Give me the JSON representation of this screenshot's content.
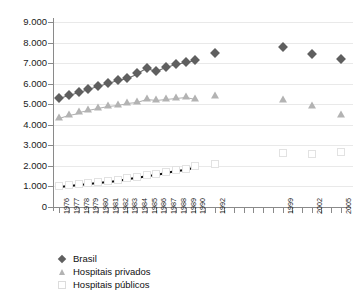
{
  "chart_data": {
    "type": "line",
    "title": "",
    "subtitle": "",
    "xlabel": "",
    "ylabel": "",
    "ylim": [
      0,
      9000
    ],
    "ytick_labels": [
      "9.000",
      "8.000",
      "7.000",
      "6.000",
      "5.000",
      "4.000",
      "3.000",
      "2.000",
      "1.000",
      "0"
    ],
    "ytick_values": [
      9000,
      8000,
      7000,
      6000,
      5000,
      4000,
      3000,
      2000,
      1000,
      0
    ],
    "grid": true,
    "legend_position": "below-left",
    "x": [
      1976,
      1977,
      1978,
      1979,
      1980,
      1981,
      1982,
      1983,
      1984,
      1985,
      1986,
      1987,
      1988,
      1989,
      1990,
      1991,
      1992,
      1993,
      1994,
      1995,
      1996,
      1997,
      1998,
      1999,
      2000,
      2001,
      2002,
      2003,
      2004,
      2005
    ],
    "xtick_labels": [
      "1976",
      "1977",
      "1978",
      "1979",
      "1980",
      "1981",
      "1982",
      "1983",
      "1984",
      "1985",
      "1986",
      "1987",
      "1988",
      "1989",
      "1990",
      "",
      "1992",
      "",
      "",
      "",
      "",
      "",
      "",
      "1999",
      "",
      "",
      "2002",
      "",
      "",
      "2005"
    ],
    "series": [
      {
        "name": "Brasil",
        "marker": "diamond",
        "color": "#5f5f5f",
        "line_color": "#6b6b6b",
        "line_style": "solid",
        "values": [
          5300,
          5450,
          5600,
          5750,
          5900,
          6050,
          6200,
          6300,
          6500,
          6750,
          6600,
          6800,
          6950,
          7050,
          7150,
          null,
          7500,
          null,
          null,
          null,
          null,
          null,
          null,
          7800,
          null,
          null,
          7450,
          null,
          null,
          7200
        ]
      },
      {
        "name": "Hospitais privados",
        "marker": "triangle",
        "color": "#b3b3b3",
        "line_color": "#b0b0b0",
        "line_style": "solid",
        "values": [
          4350,
          4500,
          4600,
          4700,
          4800,
          4900,
          4950,
          5050,
          5100,
          5250,
          5200,
          5250,
          5300,
          5350,
          5250,
          null,
          5400,
          null,
          null,
          null,
          null,
          null,
          null,
          5200,
          null,
          null,
          4900,
          null,
          null,
          4500
        ]
      },
      {
        "name": "Hospitais públicos",
        "marker": "square",
        "color": "#e2e2e2",
        "line_color": "#111111",
        "line_style": "dashed",
        "values": [
          1000,
          1050,
          1100,
          1150,
          1200,
          1250,
          1300,
          1400,
          1450,
          1550,
          1600,
          1700,
          1800,
          1850,
          2000,
          null,
          2100,
          null,
          null,
          null,
          null,
          null,
          null,
          2650,
          null,
          null,
          2600,
          null,
          null,
          2700
        ]
      }
    ]
  },
  "legend": {
    "items": [
      {
        "label": "Brasil",
        "marker": "diamond"
      },
      {
        "label": "Hospitais privados",
        "marker": "triangle"
      },
      {
        "label": "Hospitais públicos",
        "marker": "square"
      }
    ]
  }
}
